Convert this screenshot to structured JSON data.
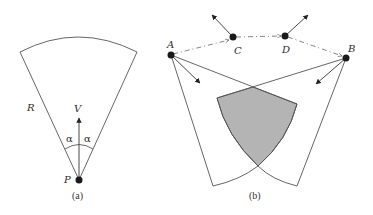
{
  "figure_a": {
    "caption": "(a)",
    "labels": {
      "radius": "R",
      "velocity": "V",
      "angle_left": "α",
      "angle_right": "α",
      "point": "P"
    }
  },
  "figure_b": {
    "caption": "(b)",
    "labels": {
      "a": "A",
      "b": "B",
      "c": "C",
      "d": "D"
    }
  },
  "colors": {
    "stroke": "#555555",
    "shade": "#b4b4b4",
    "dot": "#1a1a1a"
  }
}
